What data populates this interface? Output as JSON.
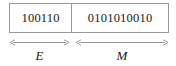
{
  "figure": {
    "background_color": "#ffffff",
    "line_color": "#9a9a9a",
    "text_color": "#1a1a1a"
  },
  "bit_field": {
    "cells": [
      {
        "id": "exponent",
        "bits": "100110",
        "bit_count": 6,
        "measure_label": "E"
      },
      {
        "id": "mantissa",
        "bits": "0101010010",
        "bit_count": 10,
        "measure_label": "M"
      }
    ]
  }
}
